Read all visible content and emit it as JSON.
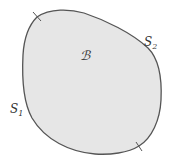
{
  "diagram": {
    "body_label": "ℬ",
    "boundary_part_1_label": "S",
    "boundary_part_1_subscript": "1",
    "boundary_part_2_label": "S",
    "boundary_part_2_subscript": "2",
    "colors": {
      "fill": "#e6e6e6",
      "stroke": "#555555",
      "text": "#333333"
    }
  }
}
